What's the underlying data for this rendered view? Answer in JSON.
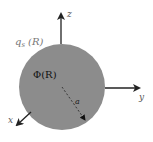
{
  "diagram": {
    "sphere": {
      "fill": "#8c8c8c",
      "cx": 62,
      "cy": 87,
      "r": 43
    },
    "axes": {
      "z": {
        "label": "z"
      },
      "y": {
        "label": "y"
      },
      "x": {
        "label": "x"
      }
    },
    "labels": {
      "surface_charge": "q",
      "surface_charge_sub": "s",
      "surface_charge_arg": "(R)",
      "potential": "Φ(R)",
      "radius": "a"
    },
    "colors": {
      "axis": "#222222",
      "label_outside": "#777777",
      "label_inside": "#111111"
    }
  }
}
